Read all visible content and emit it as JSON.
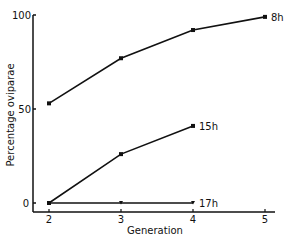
{
  "chart_data": {
    "type": "line",
    "title": "",
    "xlabel": "Generation",
    "ylabel": "Percentage oviparae",
    "x": [
      2,
      3,
      4,
      5
    ],
    "xticks": [
      "2",
      "3",
      "4",
      "5"
    ],
    "yticks": [
      "0",
      "50",
      "100"
    ],
    "ylim": [
      0,
      100
    ],
    "grid": false,
    "legend": "inline labels at line ends",
    "series": [
      {
        "name": "8h",
        "x": [
          2,
          3,
          4,
          5
        ],
        "values": [
          53,
          77,
          92,
          99
        ],
        "marker": "square"
      },
      {
        "name": "15h",
        "x": [
          2,
          3,
          4
        ],
        "values": [
          0,
          26,
          41
        ],
        "marker": "square"
      },
      {
        "name": "17h",
        "x": [
          2,
          3,
          4
        ],
        "values": [
          0,
          0,
          0
        ],
        "marker": "triangle-down"
      }
    ]
  }
}
